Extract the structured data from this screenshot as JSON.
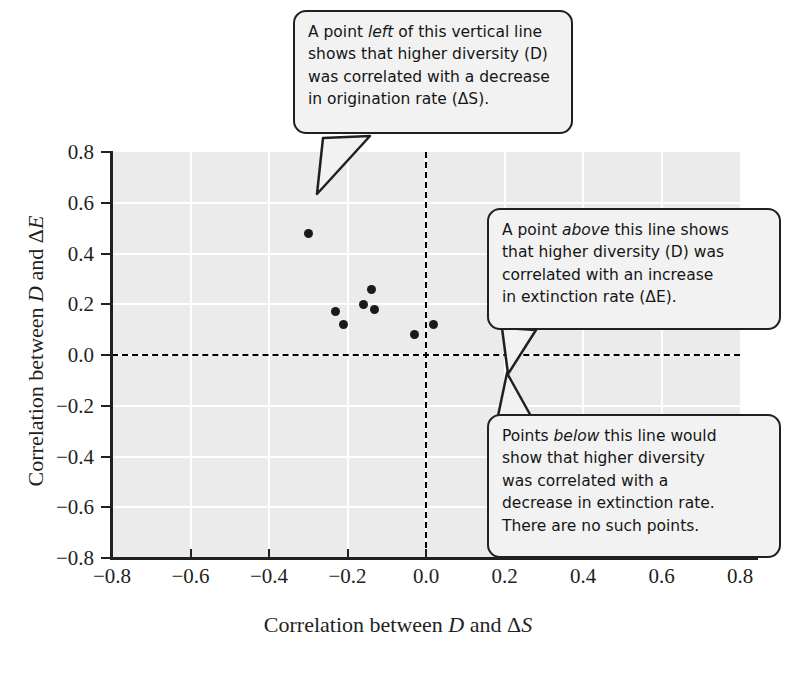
{
  "chart_data": {
    "type": "scatter",
    "title": "",
    "xlabel": "Correlation between D and ΔS",
    "ylabel": "Correlation between D and ΔE",
    "xlim": [
      -0.8,
      0.8
    ],
    "ylim": [
      -0.8,
      0.8
    ],
    "grid": true,
    "legend": "none",
    "xticks": [
      "−0.8",
      "−0.6",
      "−0.4",
      "−0.2",
      "0.0",
      "0.2",
      "0.4",
      "0.6",
      "0.8"
    ],
    "xtick_values": [
      -0.8,
      -0.6,
      -0.4,
      -0.2,
      0.0,
      0.2,
      0.4,
      0.6,
      0.8
    ],
    "yticks": [
      "0.8",
      "0.6",
      "0.4",
      "0.2",
      "0.0",
      "−0.2",
      "−0.4",
      "−0.6",
      "−0.8"
    ],
    "ytick_values": [
      0.8,
      0.6,
      0.4,
      0.2,
      0.0,
      -0.2,
      -0.4,
      -0.6,
      -0.8
    ],
    "points": [
      {
        "x": -0.3,
        "y": 0.48
      },
      {
        "x": -0.23,
        "y": 0.17
      },
      {
        "x": -0.21,
        "y": 0.12
      },
      {
        "x": -0.16,
        "y": 0.2
      },
      {
        "x": -0.14,
        "y": 0.26
      },
      {
        "x": -0.13,
        "y": 0.18
      },
      {
        "x": -0.03,
        "y": 0.08
      },
      {
        "x": 0.02,
        "y": 0.12
      }
    ],
    "reference_lines": [
      {
        "orientation": "vertical",
        "value": 0.0,
        "style": "dashed"
      },
      {
        "orientation": "horizontal",
        "value": 0.0,
        "style": "dashed"
      }
    ],
    "annotations": [
      "A point left of this vertical line shows that higher diversity (D) was correlated with a decrease in origination rate (ΔS).",
      "A point above this line shows that higher diversity (D) was correlated with an increase in extinction rate (ΔE).",
      "Points below this line would show that higher diversity was correlated with a decrease in extinction rate. There are no such points."
    ],
    "colors": {
      "panel": "#ebebeb",
      "gridline": "#ffffff",
      "point": "#1a1a1a",
      "axis": "#231f20",
      "callout_fill": "#f2f2f2",
      "callout_border": "#231f20"
    }
  },
  "axes": {
    "xlabel_prefix": "Correlation between ",
    "xlabel_var1": "D",
    "xlabel_mid": " and Δ",
    "xlabel_var2": "S",
    "ylabel_prefix": "Correlation between ",
    "ylabel_var1": "D",
    "ylabel_mid": " and Δ",
    "ylabel_var2": "E"
  },
  "callouts": {
    "one": {
      "l1a": "A point ",
      "l1b": "left",
      "l1c": " of this vertical line",
      "l2": "shows that higher diversity (D)",
      "l3": "was correlated with a decrease",
      "l4": "in origination rate (ΔS)."
    },
    "two": {
      "l1a": "A point ",
      "l1b": "above",
      "l1c": " this line shows",
      "l2": "that higher diversity (D) was",
      "l3": "correlated with an increase",
      "l4": "in extinction rate (ΔE)."
    },
    "three": {
      "l1a": "Points ",
      "l1b": "below",
      "l1c": " this line would",
      "l2": "show that higher diversity",
      "l3": "was correlated with a",
      "l4": "decrease in extinction rate.",
      "l5": "There are no such points."
    }
  }
}
